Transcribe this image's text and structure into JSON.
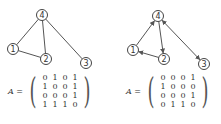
{
  "graphs": [
    {
      "type": "undirected",
      "nodes": [
        {
          "id": "1",
          "x": 13,
          "y": 49
        },
        {
          "id": "2",
          "x": 46,
          "y": 59
        },
        {
          "id": "3",
          "x": 86,
          "y": 63
        },
        {
          "id": "4",
          "x": 42,
          "y": 15
        }
      ],
      "edges": [
        [
          "1",
          "4"
        ],
        [
          "1",
          "2"
        ],
        [
          "2",
          "4"
        ],
        [
          "4",
          "3"
        ]
      ],
      "matrix_label": "A =",
      "matrix": [
        [
          0,
          1,
          0,
          1
        ],
        [
          1,
          0,
          0,
          1
        ],
        [
          0,
          0,
          0,
          1
        ],
        [
          1,
          1,
          1,
          0
        ]
      ]
    },
    {
      "type": "directed",
      "nodes": [
        {
          "id": "1",
          "x": 133,
          "y": 50
        },
        {
          "id": "2",
          "x": 164,
          "y": 59
        },
        {
          "id": "3",
          "x": 204,
          "y": 64
        },
        {
          "id": "4",
          "x": 158,
          "y": 16
        }
      ],
      "edges": [
        [
          "1",
          "4"
        ],
        [
          "2",
          "1"
        ],
        [
          "4",
          "2"
        ],
        [
          "4",
          "3"
        ],
        [
          "3",
          "4"
        ]
      ],
      "matrix_label": "A =",
      "matrix": [
        [
          0,
          0,
          0,
          1
        ],
        [
          1,
          0,
          0,
          0
        ],
        [
          0,
          0,
          0,
          1
        ],
        [
          0,
          1,
          1,
          0
        ]
      ]
    }
  ]
}
